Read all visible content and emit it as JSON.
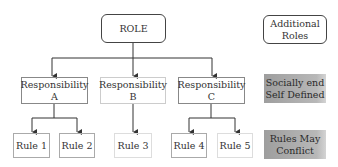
{
  "diagram": {
    "root": {
      "label": "ROLE"
    },
    "responsibilities": [
      {
        "line1": "Responsibility",
        "line2": "A"
      },
      {
        "line1": "Responsibility",
        "line2": "B"
      },
      {
        "line1": "Responsibility",
        "line2": "C"
      }
    ],
    "rules": [
      {
        "label": "Rule 1"
      },
      {
        "label": "Rule 2"
      },
      {
        "label": "Rule 3"
      },
      {
        "label": "Rule 4"
      },
      {
        "label": "Rule 5"
      }
    ],
    "side_notes": [
      {
        "line1": "Additional",
        "line2": "Roles"
      },
      {
        "line1": "Socially end",
        "line2": "Self Defined"
      },
      {
        "line1": "Rules May",
        "line2": "Conflict"
      }
    ],
    "colors": {
      "line": "#333333",
      "note_fill": "#a8a8a8"
    }
  }
}
